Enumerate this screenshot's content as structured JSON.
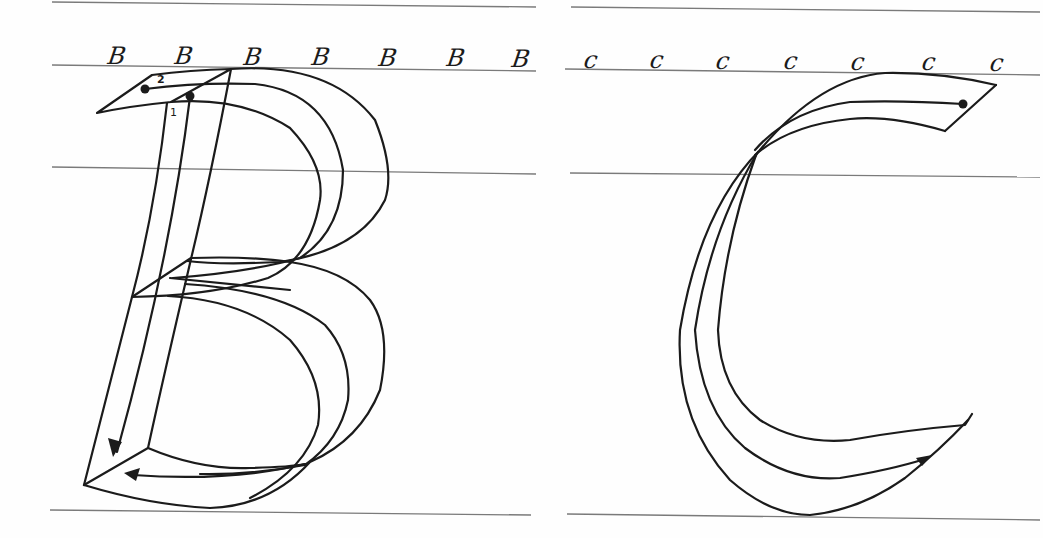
{
  "worksheet": {
    "type": "calligraphy letter construction practice sheet",
    "ink_color": "#1b1b1b",
    "guide_line_color": "#7a7a7a",
    "background_color": "#fefefe"
  },
  "panels": [
    {
      "letter": "B",
      "example_row": [
        "B",
        "B",
        "B",
        "B",
        "B",
        "B",
        "B"
      ],
      "stroke_labels": [
        {
          "number": "1",
          "description": "downstroke of the stem"
        },
        {
          "number": "2",
          "description": "top bowl stroke with lower bowl"
        }
      ]
    },
    {
      "letter": "C",
      "example_row": [
        "c",
        "c",
        "c",
        "c",
        "c",
        "c",
        "c"
      ],
      "stroke_labels": []
    }
  ]
}
